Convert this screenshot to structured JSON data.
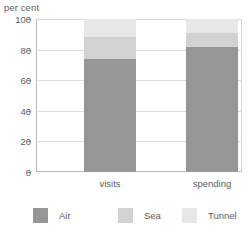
{
  "chart_data": {
    "type": "bar",
    "subtype": "stacked-bar",
    "title": "",
    "xlabel": "",
    "ylabel": "per cent",
    "ylim": [
      0,
      100
    ],
    "yticks": [
      0,
      20,
      40,
      60,
      80,
      100
    ],
    "ytick_labels": [
      "0",
      "20",
      "40",
      "60",
      "80",
      "100"
    ],
    "grid": true,
    "grid_axis": "y",
    "legend_position": "bottom",
    "categories": [
      "visits",
      "spending"
    ],
    "series": [
      {
        "name": "Air",
        "color": "#969696",
        "values": [
          74,
          82
        ]
      },
      {
        "name": "Sea",
        "color": "#d2d2d2",
        "values": [
          14,
          9
        ]
      },
      {
        "name": "Tunnel",
        "color": "#e7e7e7",
        "values": [
          12,
          9
        ]
      }
    ]
  },
  "axis": {
    "unit_caption": "per cent"
  },
  "legend": {
    "items": [
      {
        "label": "Air",
        "color": "#969696"
      },
      {
        "label": "Sea",
        "color": "#d2d2d2"
      },
      {
        "label": "Tunnel",
        "color": "#e7e7e7"
      }
    ]
  }
}
